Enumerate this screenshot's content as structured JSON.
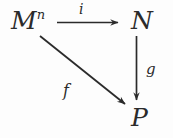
{
  "diagram": {
    "kind": "commutative-diagram",
    "ink_color": "#2b2b2b",
    "background_color": "#fdfdfd",
    "nodes": [
      {
        "id": "M",
        "base": "M",
        "superscript": "n",
        "x": 11,
        "y": 8
      },
      {
        "id": "N",
        "base": "N",
        "superscript": "",
        "x": 131,
        "y": 8
      },
      {
        "id": "P",
        "base": "P",
        "superscript": "",
        "x": 131,
        "y": 105
      }
    ],
    "arrows": [
      {
        "id": "i",
        "label": "i",
        "from": "M",
        "to": "N",
        "direction": "right"
      },
      {
        "id": "g",
        "label": "g",
        "from": "N",
        "to": "P",
        "direction": "down"
      },
      {
        "id": "f",
        "label": "f",
        "from": "M",
        "to": "P",
        "direction": "diagonal-down-right"
      }
    ]
  }
}
